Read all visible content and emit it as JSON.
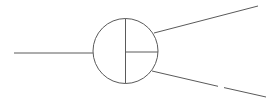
{
  "diagram": {
    "stroke_color": "#5a5a5a",
    "stroke_width": 1,
    "background": "#ffffff",
    "node": {
      "shape": "circle",
      "cx": 125.5,
      "cy": 51,
      "r": 32.5,
      "dividers": [
        {
          "x1": 125.5,
          "y1": 18.5,
          "x2": 125.5,
          "y2": 83.5
        },
        {
          "x1": 125.5,
          "y1": 52,
          "x2": 158,
          "y2": 52
        }
      ]
    },
    "edges": [
      {
        "name": "left-input-line",
        "x1": 14,
        "y1": 53,
        "x2": 93,
        "y2": 53
      },
      {
        "name": "upper-right-output-line",
        "x1": 154,
        "y1": 33,
        "x2": 258,
        "y2": 6
      },
      {
        "name": "lower-right-output-line-segment-1",
        "x1": 152,
        "y1": 71,
        "x2": 218,
        "y2": 86.3
      },
      {
        "name": "lower-right-output-line-segment-2",
        "x1": 224,
        "y1": 87.6,
        "x2": 266,
        "y2": 97
      }
    ]
  }
}
